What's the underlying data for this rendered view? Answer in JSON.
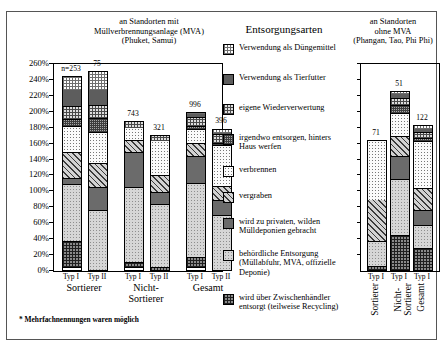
{
  "titles": {
    "left": "an Standorten mit\nMüllverbrennungsanlage (MVA)\n(Phuket, Samui)",
    "legend": "Entsorgungsarten",
    "right": "an Standorten\nohne MVA\n(Phangan, Tao, Phi Phi)"
  },
  "footnote": "* Mehrfachnennungen waren möglich",
  "legend_items": [
    {
      "label": "Verwendung als Düngemittel",
      "pattern": "p0"
    },
    {
      "label": "Verwendung als Tierfutter",
      "pattern": "p1"
    },
    {
      "label": "eigene Wiederverwertung",
      "pattern": "p2"
    },
    {
      "label": "irgendwo entsorgen, hinters Haus werfen",
      "pattern": "p3"
    },
    {
      "label": "verbrennen",
      "pattern": "p4"
    },
    {
      "label": "vergraben",
      "pattern": "p5"
    },
    {
      "label": "wird zu privaten, wilden Mülldeponien gebracht",
      "pattern": "p6"
    },
    {
      "label": "behördliche Entsorgung (Müllabfuhr, MVA, offizielle Deponie)",
      "pattern": "p7"
    },
    {
      "label": "wird über Zwischenhändler entsorgt (teilweise Recycling)",
      "pattern": "p8"
    }
  ],
  "chart_data": {
    "type": "bar",
    "subtype": "stacked",
    "ylabel": "",
    "xlabel": "",
    "ylim": [
      0,
      260
    ],
    "yticks": [
      "0%",
      "20%",
      "40%",
      "60%",
      "80%",
      "100%",
      "120%",
      "140%",
      "160%",
      "180%",
      "200%",
      "220%",
      "240%",
      "260%"
    ],
    "grid": false,
    "legend_position": "center",
    "series": [
      {
        "name": "Verwendung als Düngemittel",
        "values": [
          16,
          22,
          0,
          0,
          2,
          4,
          0,
          3,
          4
        ]
      },
      {
        "name": "Verwendung als Tierfutter",
        "values": [
          22,
          21,
          0,
          0,
          5,
          3,
          0,
          6,
          5
        ]
      },
      {
        "name": "eigene Wiederverwertung",
        "values": [
          16,
          16,
          8,
          6,
          11,
          11,
          0,
          8,
          8
        ]
      },
      {
        "name": "irgendwo entsorgen, hinters Haus werfen",
        "values": [
          9,
          18,
          0,
          0,
          4,
          3,
          0,
          10,
          4
        ]
      },
      {
        "name": "verbrennen",
        "values": [
          33,
          38,
          16,
          44,
          17,
          51,
          74,
          30,
          59
        ]
      },
      {
        "name": "vergraben",
        "values": [
          32,
          30,
          15,
          22,
          16,
          18,
          52,
          25,
          27
        ]
      },
      {
        "name": "wird zu privaten, wilden Mülldeponien gebracht",
        "values": [
          8,
          29,
          44,
          15,
          35,
          19,
          0,
          29,
          19
        ]
      },
      {
        "name": "behördliche Entsorgung (Müllabfuhr, MVA, offizielle Deponie)",
        "values": [
          72,
          83,
          95,
          79,
          93,
          79,
          32,
          70,
          29
        ]
      },
      {
        "name": "wird über Zwischenhändler entsorgt (teilweise Recycling)",
        "values": [
          32,
          24,
          6,
          5,
          12,
          6,
          5,
          70,
          33
        ]
      }
    ],
    "bars": [
      {
        "panel": "left",
        "group": "Sortierer",
        "type": "Typ I",
        "n": "n=253",
        "total": 245
      },
      {
        "panel": "left",
        "group": "Sortierer",
        "type": "Typ II",
        "n": "75",
        "total": 251
      },
      {
        "panel": "left",
        "group": "Nicht-Sortierer",
        "type": "Typ I",
        "n": "743",
        "total": 189
      },
      {
        "panel": "left",
        "group": "Nicht-Sortierer",
        "type": "Typ II",
        "n": "321",
        "total": 171
      },
      {
        "panel": "left",
        "group": "Gesamt",
        "type": "Typ I",
        "n": "996",
        "total": 200
      },
      {
        "panel": "left",
        "group": "Gesamt",
        "type": "Typ II",
        "n": "396",
        "total": 179
      },
      {
        "panel": "right",
        "group": "Sortierer",
        "type": "Typ I",
        "n": "71",
        "total": 164
      },
      {
        "panel": "right",
        "group": "Nicht-Sortierer",
        "type": "Typ I",
        "n": "51",
        "total": 226
      },
      {
        "panel": "right",
        "group": "Gesamt",
        "type": "Typ I",
        "n": "122",
        "total": 184
      }
    ],
    "group_labels_left": [
      "Sortierer",
      "Nicht-Sortierer",
      "Gesamt"
    ],
    "group_labels_right": [
      "Sortierer",
      "Nicht-Sortierer",
      "Gesamt"
    ],
    "bar_type_labels_left": [
      "Typ I",
      "Typ II",
      "Typ I",
      "Typ II",
      "Typ I",
      "Typ II"
    ],
    "bar_type_labels_right": [
      "Typ I",
      "Typ I",
      "Typ I"
    ]
  }
}
